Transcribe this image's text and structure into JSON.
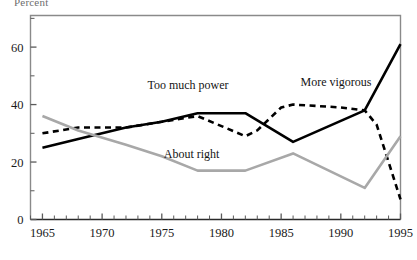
{
  "chart_data": {
    "type": "line",
    "title": "Percent",
    "xlabel": "",
    "ylabel": "",
    "xlim": [
      1964,
      1995
    ],
    "ylim": [
      0,
      71
    ],
    "grid": false,
    "legend_position": "inline-annotations",
    "xticks": [
      1965,
      1970,
      1975,
      1980,
      1985,
      1990,
      1995
    ],
    "xtick_labels": [
      "1965",
      "1970",
      "1975",
      "1980",
      "1985",
      "1990",
      "1995"
    ],
    "minor_xtick_interval": 1,
    "yticks": [
      0,
      20,
      40,
      60
    ],
    "ytick_labels": [
      "0",
      "20",
      "40",
      "60"
    ],
    "series": [
      {
        "name": "Too much power",
        "style": "solid",
        "color": "#000000",
        "width": 2.6,
        "label_x": 1977.2,
        "label_y": 45.5,
        "points": [
          {
            "x": 1965,
            "y": 25
          },
          {
            "x": 1968,
            "y": 28
          },
          {
            "x": 1972,
            "y": 32
          },
          {
            "x": 1975,
            "y": 34
          },
          {
            "x": 1978,
            "y": 37
          },
          {
            "x": 1982,
            "y": 37
          },
          {
            "x": 1986,
            "y": 27
          },
          {
            "x": 1992,
            "y": 38
          },
          {
            "x": 1995,
            "y": 61
          }
        ]
      },
      {
        "name": "More vigorous",
        "style": "dashed",
        "color": "#000000",
        "width": 2.6,
        "label_x": 1989.6,
        "label_y": 46.5,
        "points": [
          {
            "x": 1965,
            "y": 30
          },
          {
            "x": 1968,
            "y": 32
          },
          {
            "x": 1972,
            "y": 32
          },
          {
            "x": 1975,
            "y": 34
          },
          {
            "x": 1978,
            "y": 36
          },
          {
            "x": 1982,
            "y": 29
          },
          {
            "x": 1983,
            "y": 31
          },
          {
            "x": 1985,
            "y": 39
          },
          {
            "x": 1986,
            "y": 40
          },
          {
            "x": 1990,
            "y": 39
          },
          {
            "x": 1992,
            "y": 38
          },
          {
            "x": 1993,
            "y": 33
          },
          {
            "x": 1995,
            "y": 7
          }
        ]
      },
      {
        "name": "About right",
        "style": "solid",
        "color": "#a8a8a8",
        "width": 2.6,
        "label_x": 1977.5,
        "label_y": 21.5,
        "points": [
          {
            "x": 1965,
            "y": 36
          },
          {
            "x": 1968,
            "y": 31
          },
          {
            "x": 1972,
            "y": 26
          },
          {
            "x": 1975,
            "y": 22
          },
          {
            "x": 1978,
            "y": 17
          },
          {
            "x": 1982,
            "y": 17
          },
          {
            "x": 1986,
            "y": 23
          },
          {
            "x": 1992,
            "y": 11
          },
          {
            "x": 1995,
            "y": 29
          }
        ]
      }
    ]
  },
  "axes": {
    "frame_color": "#8a8a8a",
    "tick_color": "#5a5a5a",
    "text_color": "#1a1a1a"
  }
}
